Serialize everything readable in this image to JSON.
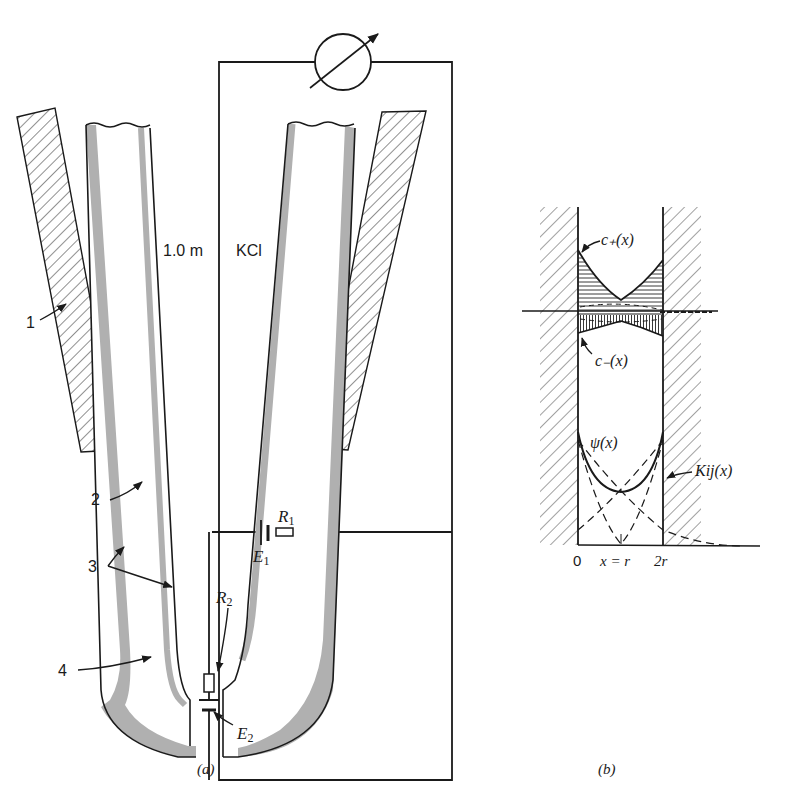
{
  "figure": {
    "panel_a": {
      "caption": "(a)",
      "labels": {
        "concentration": "1.0 m",
        "solution": "KCl",
        "part_1": "1",
        "part_2": "2",
        "part_3": "3",
        "part_4": "4",
        "r1": "R",
        "r1_sub": "1",
        "r2": "R",
        "r2_sub": "2",
        "e1": "E",
        "e1_sub": "1",
        "e2": "E",
        "e2_sub": "2"
      },
      "meter_symbol": "variable-meter-icon"
    },
    "panel_b": {
      "caption": "(b)",
      "labels": {
        "c_plus": "c₊(x)",
        "c_minus": "c₋(x)",
        "psi": "ψ(x)",
        "kij": "Kij(x)",
        "axis_0": "0",
        "axis_r": "x = r",
        "axis_2r": "2r"
      }
    },
    "colors": {
      "ink": "#1a1a1a",
      "glass_shade": "#b0b0b0",
      "seal": "#111111",
      "background": "#ffffff"
    }
  }
}
